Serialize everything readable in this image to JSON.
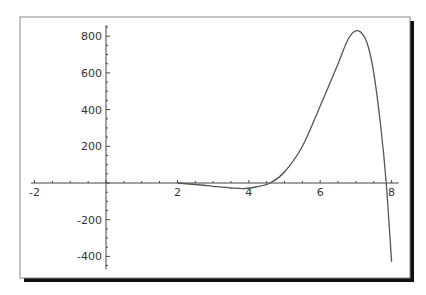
{
  "chart_data": {
    "type": "line",
    "title": "",
    "xlabel": "",
    "ylabel": "",
    "xlim": [
      -2.1,
      8.2
    ],
    "ylim": [
      -470,
      860
    ],
    "grid": false,
    "legend": null,
    "x_ticks": [
      -2,
      2,
      4,
      6,
      8
    ],
    "x_tick_labels": [
      "-2",
      "2",
      "4",
      "6",
      "8"
    ],
    "y_ticks": [
      -400,
      -200,
      200,
      400,
      600,
      800
    ],
    "y_tick_labels": [
      "-400",
      "-200",
      "200",
      "400",
      "600",
      "800"
    ],
    "series": [
      {
        "name": "f(x)",
        "color": "#555555",
        "x": [
          2.0,
          2.5,
          3.0,
          3.5,
          3.9,
          4.2,
          4.6,
          5.0,
          5.5,
          6.0,
          6.5,
          6.8,
          7.05,
          7.3,
          7.5,
          7.7,
          7.85,
          8.0
        ],
        "y": [
          0,
          -8,
          -18,
          -27,
          -30,
          -22,
          0,
          60,
          200,
          420,
          650,
          790,
          830,
          770,
          600,
          300,
          0,
          -430
        ]
      }
    ]
  },
  "frame": {
    "border_color": "#888888",
    "shadow_color": "#111111"
  }
}
